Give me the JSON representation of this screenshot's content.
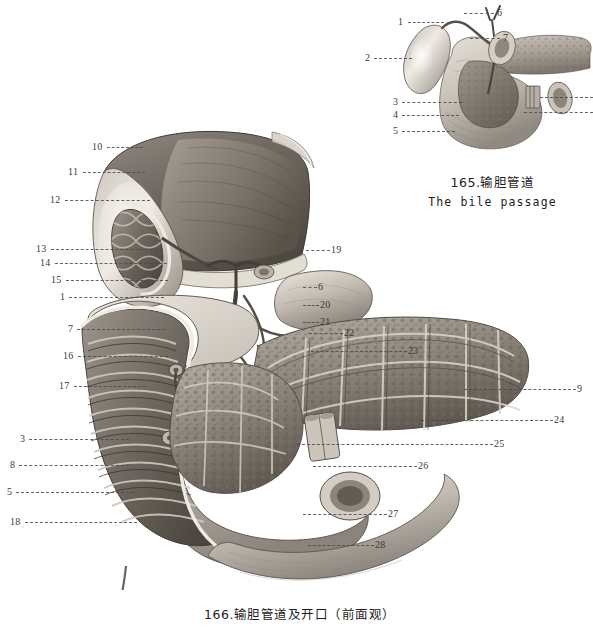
{
  "page": {
    "background": "#ffffff",
    "width": 593,
    "height": 629,
    "ink": "#3a3a3a"
  },
  "inset_figure": {
    "name": "bile-passage-inset",
    "caption_cn": "165.输胆管道",
    "caption_en": "The  bile  passage",
    "labels": [
      {
        "n": "1",
        "x": 398,
        "y": 22,
        "side": "left",
        "len": 36
      },
      {
        "n": "2",
        "x": 365,
        "y": 58,
        "side": "left",
        "len": 38
      },
      {
        "n": "3",
        "x": 393,
        "y": 102,
        "side": "left",
        "len": 60
      },
      {
        "n": "4",
        "x": 393,
        "y": 115,
        "side": "left",
        "len": 57
      },
      {
        "n": "5",
        "x": 393,
        "y": 131,
        "side": "left",
        "len": 53
      },
      {
        "n": "6",
        "x": 497,
        "y": 13,
        "side": "right",
        "len": 30
      },
      {
        "n": "7",
        "x": 503,
        "y": 38,
        "side": "right",
        "len": 30
      }
    ],
    "edge_leaders": [
      {
        "x": 540,
        "y": 97,
        "len": 53
      },
      {
        "x": 524,
        "y": 112,
        "len": 69
      }
    ]
  },
  "main_figure": {
    "name": "bile-passage-anterior-view",
    "caption_cn": "166.输胆管道及开口（前面观）",
    "labels_left": [
      {
        "n": "10",
        "x": 92,
        "y": 147,
        "len": 36
      },
      {
        "n": "11",
        "x": 68,
        "y": 172,
        "len": 62
      },
      {
        "n": "12",
        "x": 50,
        "y": 200,
        "len": 85
      },
      {
        "n": "13",
        "x": 36,
        "y": 249,
        "len": 112
      },
      {
        "n": "14",
        "x": 40,
        "y": 263,
        "len": 112
      },
      {
        "n": "15",
        "x": 51,
        "y": 280,
        "len": 102
      },
      {
        "n": "1",
        "x": 60,
        "y": 297,
        "len": 95
      },
      {
        "n": "7",
        "x": 68,
        "y": 329,
        "len": 88
      },
      {
        "n": "16",
        "x": 63,
        "y": 356,
        "len": 90
      },
      {
        "n": "17",
        "x": 59,
        "y": 386,
        "len": 72
      },
      {
        "n": "3",
        "x": 20,
        "y": 439,
        "len": 100
      },
      {
        "n": "8",
        "x": 10,
        "y": 465,
        "len": 110
      },
      {
        "n": "5",
        "x": 7,
        "y": 492,
        "len": 118
      },
      {
        "n": "18",
        "x": 10,
        "y": 522,
        "len": 112
      }
    ],
    "labels_right": [
      {
        "n": "19",
        "x": 331,
        "y": 250,
        "len": 24
      },
      {
        "n": "6",
        "x": 318,
        "y": 287,
        "len": 14
      },
      {
        "n": "20",
        "x": 320,
        "y": 305,
        "len": 16
      },
      {
        "n": "21",
        "x": 320,
        "y": 322,
        "len": 16
      },
      {
        "n": "22",
        "x": 344,
        "y": 333,
        "len": 34
      },
      {
        "n": "23",
        "x": 408,
        "y": 351,
        "len": 96
      },
      {
        "n": "9",
        "x": 577,
        "y": 389,
        "len": 112
      },
      {
        "n": "24",
        "x": 554,
        "y": 420,
        "len": 132
      },
      {
        "n": "25",
        "x": 494,
        "y": 444,
        "len": 196
      },
      {
        "n": "26",
        "x": 418,
        "y": 466,
        "len": 104
      },
      {
        "n": "27",
        "x": 388,
        "y": 514,
        "len": 84
      },
      {
        "n": "28",
        "x": 375,
        "y": 545,
        "len": 66
      }
    ]
  }
}
